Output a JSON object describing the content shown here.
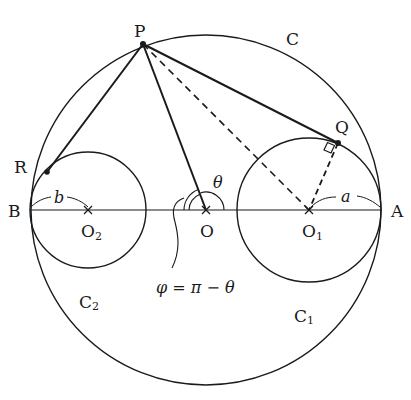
{
  "diagram": {
    "type": "geometry",
    "stroke_color": "#1a1a1a",
    "background": "#ffffff",
    "labels": {
      "P": "P",
      "C": "C",
      "Q": "Q",
      "R": "R",
      "B": "B",
      "A": "A",
      "O": "O",
      "O1_main": "O",
      "O1_sub": "1",
      "O2_main": "O",
      "O2_sub": "2",
      "C1_main": "C",
      "C1_sub": "1",
      "C2_main": "C",
      "C2_sub": "2",
      "a": "a",
      "b": "b",
      "theta": "θ",
      "phi_formula": "φ = π − θ"
    },
    "points": {
      "O": [
        206,
        210
      ],
      "O1": [
        309,
        210
      ],
      "O2": [
        88,
        210
      ],
      "A": [
        381,
        210
      ],
      "B": [
        30,
        210
      ],
      "P": [
        143,
        44
      ],
      "Q": [
        338,
        143
      ],
      "R": [
        47,
        172
      ]
    },
    "circles": [
      {
        "name": "C",
        "center": "O",
        "radius": 175
      },
      {
        "name": "C1",
        "center": "O1",
        "radius": 72
      },
      {
        "name": "C2",
        "center": "O2",
        "radius": 58
      }
    ],
    "segments": [
      {
        "from": "P",
        "to": "Q",
        "style": "solid"
      },
      {
        "from": "P",
        "to": "R",
        "style": "solid"
      },
      {
        "from": "P",
        "to": "O",
        "style": "solid"
      },
      {
        "from": "P",
        "to": "O1",
        "style": "dashed"
      },
      {
        "from": "Q",
        "to": "O1",
        "style": "dashed"
      },
      {
        "from": "B",
        "to": "A",
        "style": "solid"
      }
    ],
    "annotations": [
      {
        "type": "right-angle",
        "at": "Q"
      },
      {
        "type": "angle",
        "at": "O",
        "label": "θ",
        "between": [
          "OA",
          "OP"
        ]
      },
      {
        "type": "angle",
        "at": "O",
        "label": "φ",
        "between": [
          "OP",
          "OB"
        ]
      }
    ]
  }
}
